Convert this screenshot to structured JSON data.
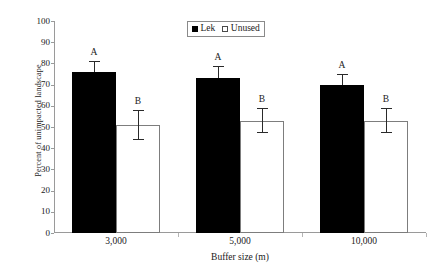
{
  "chart_data": {
    "type": "bar",
    "title": "",
    "subtitle": "",
    "xlabel": "Buffer size (m)",
    "ylabel": "Percent of unimpacted landscape",
    "categories": [
      "3,000",
      "5,000",
      "10,000"
    ],
    "ylim": [
      0,
      100
    ],
    "ytick_labels": [
      "0",
      "10",
      "20",
      "30",
      "40",
      "50",
      "60",
      "70",
      "80",
      "90",
      "100"
    ],
    "ytick_values": [
      0,
      10,
      20,
      30,
      40,
      50,
      60,
      70,
      80,
      90,
      100
    ],
    "grid": false,
    "legend_position": "top-center",
    "series": [
      {
        "name": "Lek",
        "color": "#000000",
        "fill": "solid",
        "values": [
          76,
          73,
          70
        ],
        "error_upper": [
          81,
          79,
          75
        ],
        "error_lower": [
          76,
          73,
          70
        ],
        "annotations": [
          "A",
          "A",
          "A"
        ]
      },
      {
        "name": "Unused",
        "color": "#ffffff",
        "fill": "open",
        "values": [
          51,
          53,
          53
        ],
        "error_upper": [
          58,
          59,
          59
        ],
        "error_lower": [
          44,
          47,
          47
        ],
        "annotations": [
          "B",
          "B",
          "B"
        ]
      }
    ],
    "legend_entries": [
      "Lek",
      "Unused"
    ],
    "annotation_note": "Letters A and B denote significantly different groups"
  },
  "axis": {
    "y_title": "Percent of unimpacted landscape",
    "x_title": "Buffer size (m)"
  },
  "legend": {
    "items": [
      {
        "label": "Lek",
        "swatch": "filled-square-icon"
      },
      {
        "label": "Unused",
        "swatch": "open-square-icon"
      }
    ]
  }
}
